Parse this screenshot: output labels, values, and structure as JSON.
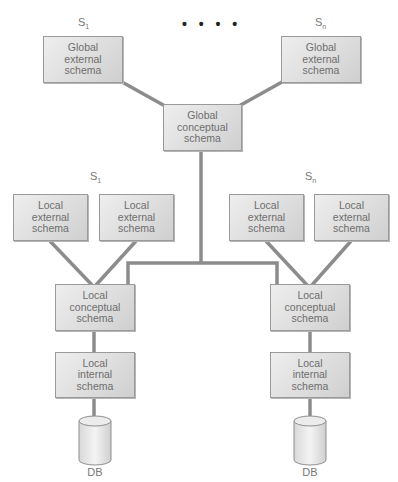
{
  "diagram": {
    "type": "distributed-database-schema-architecture",
    "ellipsis": "• • • •",
    "site_labels": {
      "top_left": {
        "base": "S",
        "sub": "1"
      },
      "top_right": {
        "base": "S",
        "sub": "n"
      },
      "mid_left": {
        "base": "S",
        "sub": "1"
      },
      "mid_right": {
        "base": "S",
        "sub": "n"
      }
    },
    "global_external_left": "Global\nexternal\nschema",
    "global_external_right": "Global\nexternal\nschema",
    "global_conceptual": "Global\nconceptual\nschema",
    "site1": {
      "local_external_a": "Local\nexternal\nschema",
      "local_external_b": "Local\nexternal\nschema",
      "local_conceptual": "Local\nconceptual\nschema",
      "local_internal": "Local\ninternal\nschema",
      "db": "DB"
    },
    "siten": {
      "local_external_a": "Local\nexternal\nschema",
      "local_external_b": "Local\nexternal\nschema",
      "local_conceptual": "Local\nconceptual\nschema",
      "local_internal": "Local\ninternal\nschema",
      "db": "DB"
    },
    "colors": {
      "box_fill": "#dcdcdc",
      "box_border": "#9a9a9a",
      "connector": "#8c8c8c",
      "text": "#6e6e6e"
    }
  }
}
